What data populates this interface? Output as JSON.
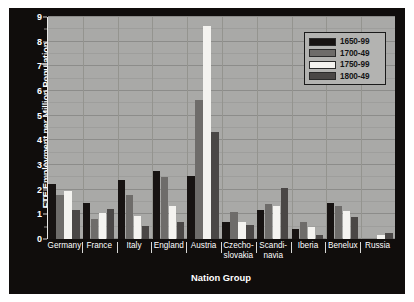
{
  "chart_data": {
    "type": "bar",
    "title": "",
    "xlabel": "Nation Group",
    "ylabel": "FTE Employment per Million Population",
    "ylim": [
      0,
      9
    ],
    "yticks": [
      0,
      1,
      2,
      3,
      4,
      5,
      6,
      7,
      8,
      9
    ],
    "ytick_labels": [
      "0",
      "1",
      "2",
      "3",
      "4",
      "5",
      "6",
      "7",
      "8",
      "9"
    ],
    "grid": true,
    "grid_minor_step": 0.5,
    "legend_position": "top-right",
    "categories": [
      "Germany",
      "France",
      "Italy",
      "England",
      "Austria",
      "Czecho-\nslovakia",
      "Scandi-\nnavia",
      "Iberia",
      "Benelux",
      "Russia"
    ],
    "series": [
      {
        "name": "1650-99",
        "color": "#171312",
        "values": [
          2.22,
          1.48,
          2.4,
          2.74,
          2.54,
          0.68,
          1.16,
          0.42,
          1.45,
          0.0
        ]
      },
      {
        "name": "1700-49",
        "color": "#6e6c6a",
        "values": [
          1.8,
          0.8,
          1.77,
          2.5,
          5.64,
          1.1,
          1.4,
          0.71,
          1.35,
          0.0
        ]
      },
      {
        "name": "1750-99",
        "color": "#f4f3f0",
        "values": [
          1.95,
          1.05,
          0.95,
          1.34,
          8.64,
          0.7,
          1.34,
          0.47,
          1.12,
          0.17
        ]
      },
      {
        "name": "1800-49",
        "color": "#4a4746",
        "values": [
          1.19,
          1.2,
          0.52,
          0.71,
          4.35,
          0.57,
          2.08,
          0.15,
          0.88,
          0.25
        ]
      }
    ]
  },
  "figure": {
    "background": "#100d0c",
    "plot_background": "#a9a9a7",
    "axis_text_color": "#ffffff"
  }
}
